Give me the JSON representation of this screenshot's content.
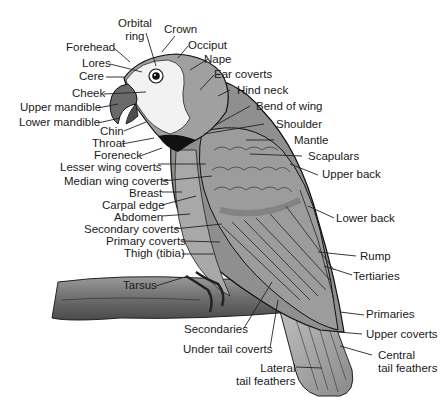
{
  "diagram": {
    "colors": {
      "background": "#ffffff",
      "body_gray": "#8f8f8f",
      "light_gray": "#b8b8b8",
      "face_white": "#f2f2f2",
      "dark_gray": "#5e5e5e",
      "black": "#111111",
      "label_text": "#1a1a1a",
      "leader_line": "#222222"
    },
    "labels": {
      "orbital_ring": "Orbital\nring",
      "crown": "Crown",
      "occiput": "Occiput",
      "forehead": "Forehead",
      "nape": "Nape",
      "lores": "Lores",
      "ear_coverts": "Ear coverts",
      "cere": "Cere",
      "hind_neck": "Hind neck",
      "cheek": "Cheek",
      "upper_mandible": "Upper mandible",
      "bend_of_wing": "Bend of wing",
      "lower_mandible": "Lower mandible",
      "shoulder": "Shoulder",
      "chin": "Chin",
      "throat": "Throat",
      "mantle": "Mantle",
      "foreneck": "Foreneck",
      "scapulars": "Scapulars",
      "lesser_wing_coverts": "Lesser wing coverts",
      "upper_back": "Upper back",
      "median_wing_coverts": "Median wing coverts",
      "breast": "Breast",
      "carpal_edge": "Carpal edge",
      "abdomen": "Abdomen",
      "lower_back": "Lower back",
      "secondary_coverts": "Secondary coverts",
      "primary_coverts": "Primary coverts",
      "thigh": "Thigh (tibia)",
      "rump": "Rump",
      "tertiaries": "Tertiaries",
      "tarsus": "Tarsus",
      "primaries": "Primaries",
      "secondaries": "Secondaries",
      "upper_coverts": "Upper coverts",
      "under_tail_coverts": "Under tail coverts",
      "central_tail_feathers": "Central\ntail feathers",
      "lateral_tail_feathers": "Lateral\ntail feathers"
    }
  }
}
